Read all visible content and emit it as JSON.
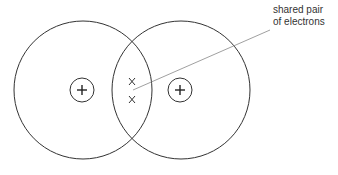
{
  "diagram": {
    "annotation": {
      "line1": "shared pair",
      "line2": "of electrons"
    },
    "atoms": [
      {
        "name": "left-atom",
        "nucleus_symbol": "+"
      },
      {
        "name": "right-atom",
        "nucleus_symbol": "+"
      }
    ],
    "shared_electrons": [
      "x",
      "x"
    ],
    "colors": {
      "stroke": "#333333",
      "leader_line": "#888888",
      "background": "#ffffff"
    }
  }
}
